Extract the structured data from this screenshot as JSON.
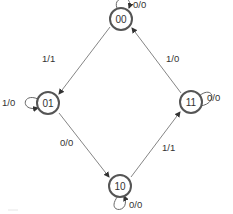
{
  "diagram": {
    "type": "state-machine",
    "states": [
      {
        "id": "00",
        "label": "00"
      },
      {
        "id": "01",
        "label": "01"
      },
      {
        "id": "11",
        "label": "11"
      },
      {
        "id": "10",
        "label": "10"
      }
    ],
    "transitions": [
      {
        "from": "00",
        "to": "00",
        "label": "0/0"
      },
      {
        "from": "00",
        "to": "01",
        "label": "1/1"
      },
      {
        "from": "01",
        "to": "01",
        "label": "1/0"
      },
      {
        "from": "01",
        "to": "10",
        "label": "0/0"
      },
      {
        "from": "10",
        "to": "10",
        "label": "0/0"
      },
      {
        "from": "10",
        "to": "11",
        "label": "1/1"
      },
      {
        "from": "11",
        "to": "11",
        "label": "0/0"
      },
      {
        "from": "11",
        "to": "00",
        "label": "1/0"
      }
    ]
  }
}
